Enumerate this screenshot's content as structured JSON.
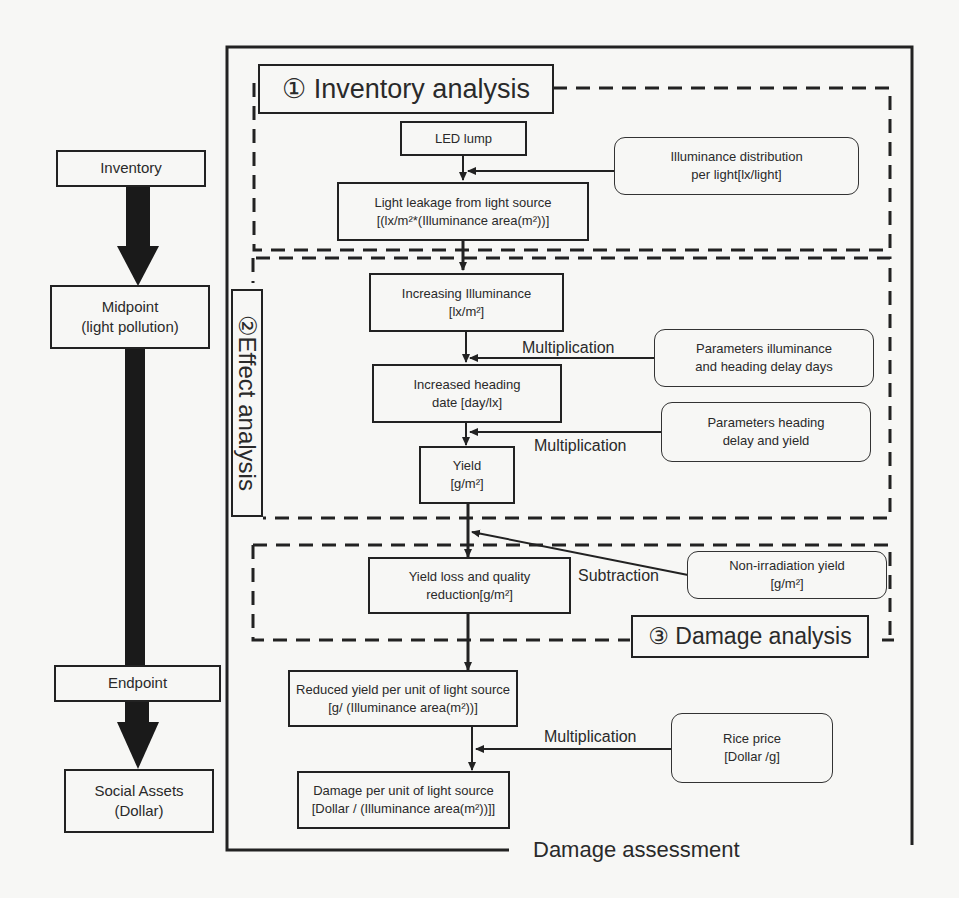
{
  "left_flow": {
    "inventory": "Inventory",
    "midpoint_line1": "Midpoint",
    "midpoint_line2": "(light pollution)",
    "endpoint": "Endpoint",
    "social_line1": "Social Assets",
    "social_line2": "(Dollar)"
  },
  "sections": {
    "inventory_analysis": "① Inventory analysis",
    "effect_analysis": "②Effect analysis",
    "damage_analysis": "③ Damage analysis",
    "damage_assessment": "Damage assessment"
  },
  "nodes": {
    "led_lump": "LED lump",
    "light_leakage_line1": "Light leakage from light source",
    "light_leakage_line2": "[(lx/m²*(Illuminance area(m²))]",
    "increasing_illuminance_line1": "Increasing Illuminance",
    "increasing_illuminance_line2": "[lx/m²]",
    "increased_heading_line1": "Increased heading",
    "increased_heading_line2": "date [day/lx]",
    "yield_line1": "Yield",
    "yield_line2": "[g/m²]",
    "yield_loss_line1": "Yield loss and quality",
    "yield_loss_line2": "reduction[g/m²]",
    "reduced_yield_line1": "Reduced yield per unit of light source",
    "reduced_yield_line2": "[g/ (Illuminance area(m²))]",
    "damage_per_unit_line1": "Damage per unit of light source",
    "damage_per_unit_line2": "[Dollar / (Illuminance area(m²))]]"
  },
  "parameters": {
    "illuminance_distribution_line1": "Illuminance distribution",
    "illuminance_distribution_line2": "per light[lx/light]",
    "params_illuminance_line1": "Parameters illuminance",
    "params_illuminance_line2": "and heading delay days",
    "params_heading_line1": "Parameters heading",
    "params_heading_line2": "delay and yield",
    "non_irradiation_line1": "Non-irradiation yield",
    "non_irradiation_line2": "[g/m²]",
    "rice_price_line1": "Rice price",
    "rice_price_line2": "[Dollar /g]"
  },
  "operations": {
    "mult1": "Multiplication",
    "mult2": "Multiplication",
    "subtraction": "Subtraction",
    "mult3": "Multiplication"
  }
}
